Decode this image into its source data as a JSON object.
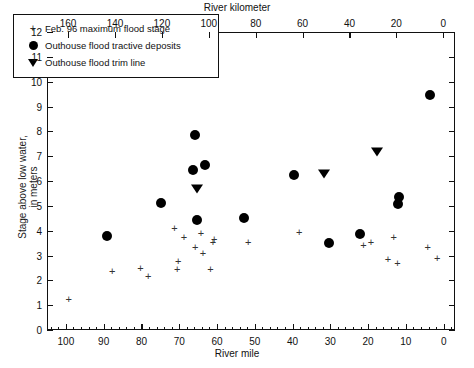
{
  "chart_data": {
    "type": "scatter",
    "title": "",
    "xlabel": "River mile",
    "xlabel_top": "River kilometer",
    "ylabel": "Stage above low water, in meters",
    "ylabel_line1": "Stage above low water,",
    "ylabel_line2": "in meters",
    "xlim": [
      105,
      -3
    ],
    "xlim_top": [
      169,
      -5
    ],
    "ylim": [
      0,
      12
    ],
    "grid": false,
    "x_ticks_bottom": [
      100,
      90,
      80,
      70,
      60,
      50,
      40,
      30,
      20,
      10,
      0
    ],
    "x_ticks_top": [
      160,
      140,
      120,
      100,
      80,
      60,
      40,
      20,
      0
    ],
    "y_ticks": [
      0,
      1,
      2,
      3,
      4,
      5,
      6,
      7,
      8,
      9,
      10,
      11,
      12
    ],
    "x_minor_tick_interval_bottom": 2,
    "legend_position": "upper-left",
    "series": [
      {
        "name": "Feb. 96 maximum flood stage",
        "marker": "plus",
        "color": "#333333",
        "points": [
          {
            "x": 99.5,
            "y": 1.3
          },
          {
            "x": 88.0,
            "y": 2.4
          },
          {
            "x": 80.5,
            "y": 2.55
          },
          {
            "x": 78.5,
            "y": 2.2
          },
          {
            "x": 71.5,
            "y": 4.15
          },
          {
            "x": 69.0,
            "y": 3.8
          },
          {
            "x": 70.5,
            "y": 2.8
          },
          {
            "x": 70.8,
            "y": 2.5
          },
          {
            "x": 66.0,
            "y": 3.4
          },
          {
            "x": 64.5,
            "y": 3.95
          },
          {
            "x": 64.0,
            "y": 3.15
          },
          {
            "x": 61.0,
            "y": 3.7
          },
          {
            "x": 61.3,
            "y": 3.6
          },
          {
            "x": 62.0,
            "y": 2.5
          },
          {
            "x": 52.0,
            "y": 3.6
          },
          {
            "x": 38.5,
            "y": 4.0
          },
          {
            "x": 21.5,
            "y": 3.45
          },
          {
            "x": 19.5,
            "y": 3.6
          },
          {
            "x": 13.5,
            "y": 3.8
          },
          {
            "x": 15.0,
            "y": 2.9
          },
          {
            "x": 12.5,
            "y": 2.75
          },
          {
            "x": 4.5,
            "y": 3.4
          },
          {
            "x": 2.0,
            "y": 2.95
          }
        ]
      },
      {
        "name": "Outhouse flood tractive deposits",
        "marker": "circle",
        "color": "#000000",
        "points": [
          {
            "x": 89.5,
            "y": 3.82
          },
          {
            "x": 75.0,
            "y": 5.15
          },
          {
            "x": 66.0,
            "y": 7.9
          },
          {
            "x": 66.5,
            "y": 6.5
          },
          {
            "x": 63.5,
            "y": 6.7
          },
          {
            "x": 65.5,
            "y": 4.45
          },
          {
            "x": 53.0,
            "y": 4.55
          },
          {
            "x": 40.0,
            "y": 6.3
          },
          {
            "x": 30.5,
            "y": 3.55
          },
          {
            "x": 22.5,
            "y": 3.9
          },
          {
            "x": 12.0,
            "y": 5.4
          },
          {
            "x": 12.3,
            "y": 5.1
          },
          {
            "x": 4.0,
            "y": 9.5
          }
        ]
      },
      {
        "name": "Outhouse flood trim line",
        "marker": "triangle-down",
        "color": "#000000",
        "points": [
          {
            "x": 65.5,
            "y": 5.75
          },
          {
            "x": 32.0,
            "y": 6.35
          },
          {
            "x": 18.0,
            "y": 7.25
          }
        ]
      }
    ]
  },
  "legend": {
    "items": [
      {
        "symbol": "plus-marker",
        "label": "Feb. 96 maximum flood stage"
      },
      {
        "symbol": "filled-circle-marker",
        "label": "Outhouse flood tractive deposits"
      },
      {
        "symbol": "filled-triangle-down-marker",
        "label": "Outhouse flood trim line"
      }
    ]
  }
}
